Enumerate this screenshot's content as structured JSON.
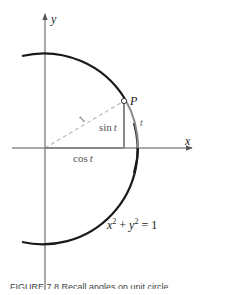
{
  "diagram": {
    "axis_labels": {
      "x": "x",
      "y": "y"
    },
    "point_label": "P",
    "hypotenuse_label": "1",
    "sin_label_fn": "sin",
    "sin_label_var": "t",
    "cos_label_fn": "cos",
    "cos_label_var": "t",
    "arc_label": "t",
    "equation": {
      "x": "x",
      "exp1": "2",
      "plus": " + ",
      "y": "y",
      "exp2": "2",
      "rest": " = 1"
    },
    "colors": {
      "circle": "#1a1a1a",
      "axes": "#555555",
      "dashed": "#bbbbbb",
      "segments": "#888888",
      "arc": "#888888"
    }
  },
  "caption": "FIGURE 7.8   Recall angles on unit circle"
}
